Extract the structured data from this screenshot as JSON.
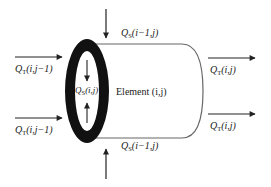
{
  "diagram": {
    "type": "finite-element flow schematic",
    "element_label": "Element (i,j)",
    "labels": {
      "qs_top": {
        "symbol": "Q",
        "sub": "S",
        "args": "(i−1,j)"
      },
      "qs_bottom": {
        "symbol": "Q",
        "sub": "S",
        "args": "(i−1,j)"
      },
      "qs_inner": {
        "symbol": "Q",
        "sub": "S",
        "args": "(i,j)"
      },
      "qt_left_top": {
        "symbol": "Q",
        "sub": "T",
        "args": "(i,j−1)"
      },
      "qt_left_bottom": {
        "symbol": "Q",
        "sub": "T",
        "args": "(i,j−1)"
      },
      "qt_right_top": {
        "symbol": "Q",
        "sub": "T",
        "args": "(i,j)"
      },
      "qt_right_bottom": {
        "symbol": "Q",
        "sub": "T",
        "args": "(i,j)"
      },
      "element": "Element (i,j)"
    },
    "colors": {
      "ring": "#111111",
      "lines": "#555555",
      "arrows": "#222222",
      "text": "#1a1a1a"
    }
  }
}
